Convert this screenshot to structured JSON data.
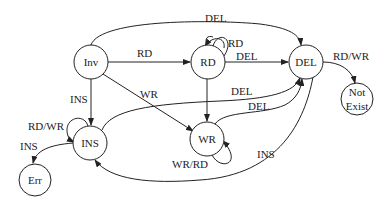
{
  "diagram": {
    "type": "state-transition-diagram",
    "nodes": [
      {
        "id": "inv",
        "label": "Inv"
      },
      {
        "id": "rd",
        "label": "RD"
      },
      {
        "id": "del",
        "label": "DEL"
      },
      {
        "id": "notexist",
        "label_line1": "Not",
        "label_line2": "Exist"
      },
      {
        "id": "ins",
        "label": "INS"
      },
      {
        "id": "wr",
        "label": "WR"
      },
      {
        "id": "err",
        "label": "Err"
      }
    ],
    "edges": [
      {
        "from": "inv",
        "to": "del",
        "label": "DEL"
      },
      {
        "from": "inv",
        "to": "rd",
        "label": "RD"
      },
      {
        "from": "rd",
        "to": "rd",
        "label": "RD"
      },
      {
        "from": "rd",
        "to": "del",
        "label": "DEL"
      },
      {
        "from": "del",
        "to": "notexist",
        "label": "RD/WR"
      },
      {
        "from": "inv",
        "to": "ins",
        "label": "INS"
      },
      {
        "from": "inv",
        "to": "wr",
        "label": "WR"
      },
      {
        "from": "ins",
        "to": "del",
        "label": "DEL"
      },
      {
        "from": "wr",
        "to": "del",
        "label": "DEL"
      },
      {
        "from": "rd",
        "to": "wr",
        "label": ""
      },
      {
        "from": "ins",
        "to": "ins",
        "label": "RD/WR"
      },
      {
        "from": "ins",
        "to": "err",
        "label": "INS"
      },
      {
        "from": "wr",
        "to": "wr",
        "label": "WR/RD"
      },
      {
        "from": "del",
        "to": "ins",
        "label": "INS"
      }
    ]
  }
}
